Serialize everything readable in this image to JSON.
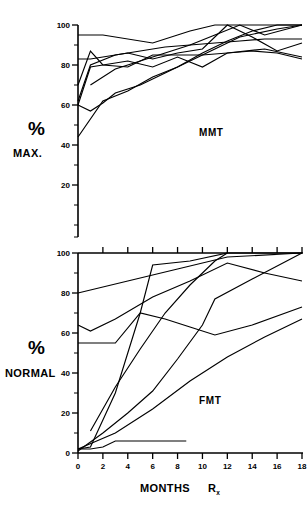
{
  "figure": {
    "width": 308,
    "height": 523,
    "background": "#ffffff",
    "ink_color": "#000000"
  },
  "axis": {
    "x_title_main": "MONTHS",
    "x_title_rx": "R",
    "x_title_rx_sub": "x",
    "percent_glyph": "%",
    "top_y_title": "MAX.",
    "bottom_y_title": "NORMAL",
    "x_ticks": [
      0,
      2,
      4,
      6,
      8,
      10,
      12,
      14,
      16,
      18
    ],
    "x_tick_labels": [
      "0",
      "2",
      "4",
      "6",
      "8",
      "10",
      "12",
      "14",
      "16",
      "18"
    ],
    "y_ticks": [
      0,
      20,
      40,
      60,
      80,
      100
    ],
    "y_tick_labels_top": [
      "20",
      "40",
      "60",
      "80",
      "100"
    ],
    "y_tick_labels_bottom": [
      "0",
      "20",
      "40",
      "60",
      "80",
      "100"
    ]
  },
  "chart_data": [
    {
      "type": "line",
      "panel": "top",
      "title": "MMT",
      "xlabel": "MONTHS Rx",
      "ylabel": "% MAX.",
      "xlim": [
        0,
        18
      ],
      "ylim": [
        0,
        100
      ],
      "grid": false,
      "legend": "none",
      "annotation": "MMT",
      "series": [
        {
          "name": "patient-1",
          "x": [
            0,
            2,
            6,
            9,
            11,
            13,
            18
          ],
          "y": [
            95,
            95,
            91,
            97,
            100,
            100,
            100
          ]
        },
        {
          "name": "patient-2",
          "x": [
            0,
            1,
            2,
            3,
            5,
            7,
            9,
            11,
            13,
            15,
            18
          ],
          "y": [
            83,
            83,
            84,
            85,
            87,
            89,
            90,
            91,
            92,
            93,
            93
          ]
        },
        {
          "name": "patient-3",
          "x": [
            0,
            1,
            2,
            4,
            6,
            8,
            10,
            12,
            14,
            16,
            18
          ],
          "y": [
            70,
            87,
            80,
            79,
            85,
            85,
            85,
            86,
            87,
            86,
            83
          ]
        },
        {
          "name": "patient-4",
          "x": [
            0,
            1,
            2,
            3,
            5,
            7,
            9,
            11,
            13,
            16,
            18
          ],
          "y": [
            60,
            57,
            61,
            66,
            70,
            76,
            82,
            88,
            94,
            98,
            100
          ]
        },
        {
          "name": "patient-5",
          "x": [
            0,
            1,
            3,
            4,
            6,
            8,
            10,
            12,
            14,
            16,
            18
          ],
          "y": [
            62,
            80,
            85,
            86,
            83,
            86,
            88,
            100,
            94,
            87,
            91
          ]
        },
        {
          "name": "patient-6",
          "x": [
            0,
            2,
            4,
            6,
            8,
            10,
            12,
            14,
            16,
            18
          ],
          "y": [
            44,
            62,
            67,
            74,
            79,
            86,
            92,
            97,
            100,
            100
          ]
        },
        {
          "name": "patient-7",
          "x": [
            1,
            3,
            5,
            7,
            9,
            11,
            13,
            15,
            18
          ],
          "y": [
            70,
            78,
            82,
            86,
            90,
            95,
            100,
            95,
            100
          ]
        },
        {
          "name": "patient-8",
          "x": [
            0,
            1,
            2,
            4,
            6,
            8,
            10,
            12,
            15,
            18
          ],
          "y": [
            60,
            79,
            80,
            82,
            79,
            84,
            79,
            86,
            88,
            84
          ]
        }
      ]
    },
    {
      "type": "line",
      "panel": "bottom",
      "title": "FMT",
      "xlabel": "MONTHS Rx",
      "ylabel": "% NORMAL",
      "xlim": [
        0,
        18
      ],
      "ylim": [
        0,
        100
      ],
      "grid": false,
      "legend": "none",
      "annotation": "FMT",
      "series": [
        {
          "name": "patient-1",
          "x": [
            0,
            4,
            8,
            12,
            18
          ],
          "y": [
            80,
            86,
            92,
            98,
            100
          ]
        },
        {
          "name": "patient-2",
          "x": [
            0,
            1,
            3,
            6,
            9,
            12,
            15,
            18
          ],
          "y": [
            64,
            61,
            67,
            78,
            86,
            95,
            90,
            86
          ]
        },
        {
          "name": "patient-3",
          "x": [
            0,
            3,
            5,
            7,
            9,
            11,
            14,
            18
          ],
          "y": [
            55,
            55,
            70,
            67,
            63,
            59,
            64,
            73
          ]
        },
        {
          "name": "patient-4",
          "x": [
            0,
            1,
            3,
            5,
            6,
            9,
            12,
            18
          ],
          "y": [
            2,
            3,
            30,
            70,
            94,
            96,
            100,
            100
          ]
        },
        {
          "name": "patient-5",
          "x": [
            1,
            3,
            5,
            7,
            9,
            11,
            12
          ],
          "y": [
            11,
            33,
            52,
            70,
            84,
            96,
            100
          ]
        },
        {
          "name": "patient-6",
          "x": [
            0,
            2,
            4,
            6,
            8,
            10,
            11,
            14,
            18
          ],
          "y": [
            1,
            10,
            20,
            31,
            47,
            64,
            77,
            87,
            100
          ]
        },
        {
          "name": "patient-7",
          "x": [
            0,
            3,
            6,
            9,
            12,
            15,
            18
          ],
          "y": [
            2,
            10,
            22,
            36,
            48,
            58,
            67
          ]
        },
        {
          "name": "patient-8",
          "x": [
            0,
            1,
            2,
            3,
            5,
            7,
            8.7
          ],
          "y": [
            2,
            2,
            3,
            6,
            6,
            6,
            6
          ]
        }
      ]
    }
  ]
}
